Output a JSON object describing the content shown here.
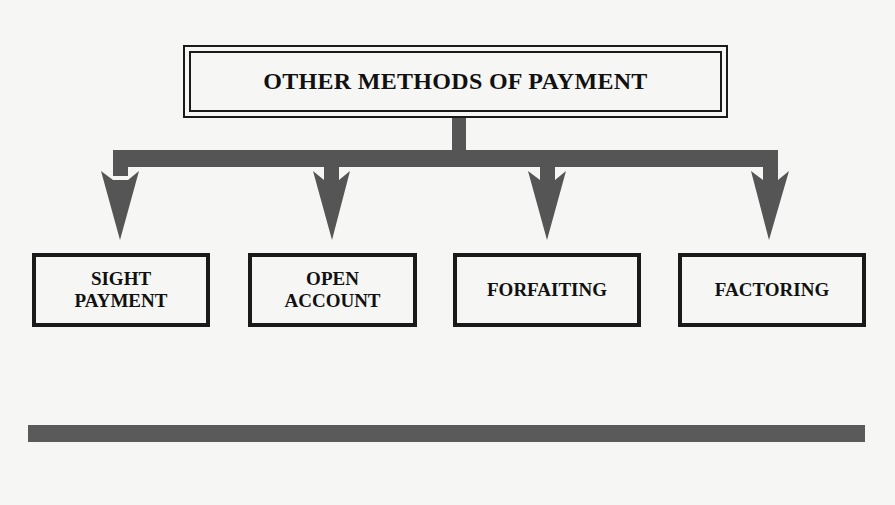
{
  "diagram": {
    "title": "OTHER METHODS OF PAYMENT",
    "children": [
      {
        "label": "SIGHT\nPAYMENT"
      },
      {
        "label": "OPEN\nACCOUNT"
      },
      {
        "label": "FORFAITING"
      },
      {
        "label": "FACTORING"
      }
    ]
  },
  "colors": {
    "background": "#f6f6f4",
    "border": "#1a1a1a",
    "connector": "#555555",
    "text": "#111111"
  }
}
